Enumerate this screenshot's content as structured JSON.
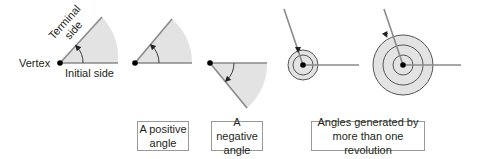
{
  "diagram": {
    "labels": {
      "vertex": "Vertex",
      "initial_side": "Initial side",
      "terminal_side_line1": "Terminal",
      "terminal_side_line2": "side"
    },
    "captions": [
      {
        "id": "positive",
        "line1": "A positive",
        "line2": "angle"
      },
      {
        "id": "negative",
        "line1": "A negative",
        "line2": "angle"
      },
      {
        "id": "multi",
        "line1": "Angles generated by",
        "line2": "more than one revolution"
      }
    ],
    "colors": {
      "sector_fill": "#e3e3e3",
      "side_stroke": "#8a8a8a",
      "arc_stroke": "#3a3a3a",
      "vertex_dot": "#000000",
      "caption_border": "#9a9a9a"
    },
    "figures": [
      {
        "id": "labeled-angle",
        "type": "positive-angle"
      },
      {
        "id": "positive-angle",
        "type": "positive-angle"
      },
      {
        "id": "negative-angle",
        "type": "negative-angle"
      },
      {
        "id": "one-plus-revolution",
        "type": "multi-revolution"
      },
      {
        "id": "two-plus-revolutions",
        "type": "multi-revolution"
      }
    ]
  }
}
